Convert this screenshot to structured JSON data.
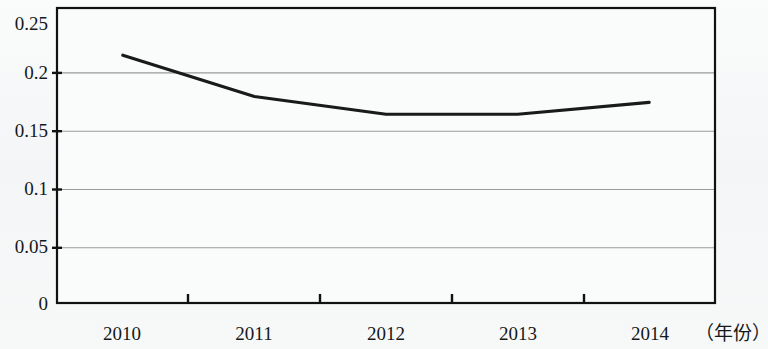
{
  "chart_data": {
    "type": "line",
    "title": "",
    "subtitle": "",
    "xlabel": "（年份）",
    "ylabel": "",
    "categories": [
      "2010",
      "2011",
      "2012",
      "2013",
      "2014"
    ],
    "values": [
      0.21,
      0.175,
      0.16,
      0.16,
      0.17
    ],
    "series": [
      {
        "name": "",
        "values": [
          0.21,
          0.175,
          0.16,
          0.16,
          0.17
        ]
      }
    ],
    "ylim": [
      0,
      0.25
    ],
    "ytick_labels": [
      "0",
      "0.05",
      "0.1",
      "0.15",
      "0.2",
      "0.25"
    ],
    "ytick_values": [
      0,
      0.05,
      0.1,
      0.15,
      0.2,
      0.25
    ],
    "xtick_labels": [
      "2010",
      "2011",
      "2012",
      "2013",
      "2014"
    ],
    "grid": true,
    "grid_axis": "y",
    "legend": false,
    "legend_position": "none",
    "annotations": [],
    "colors": {
      "line": "#1a1a1a",
      "grid": "#9a9a9a",
      "axis": "#111111",
      "plot_background": "#fafbfb",
      "page_background": "#f7f8f8",
      "text": "#15181b"
    }
  },
  "axes": {
    "y_labels": [
      {
        "text": "0.25",
        "value": 0.25
      },
      {
        "text": "0.2",
        "value": 0.2
      },
      {
        "text": "0.15",
        "value": 0.15
      },
      {
        "text": "0.1",
        "value": 0.1
      },
      {
        "text": "0.05",
        "value": 0.05
      },
      {
        "text": "0",
        "value": 0
      }
    ],
    "x_labels": [
      {
        "text": "2010"
      },
      {
        "text": "2011"
      },
      {
        "text": "2012"
      },
      {
        "text": "2013"
      },
      {
        "text": "2014"
      }
    ],
    "x_axis_title": "（年份）"
  }
}
